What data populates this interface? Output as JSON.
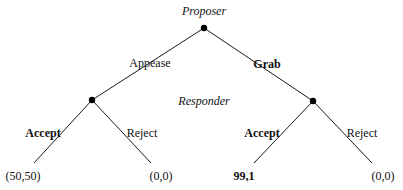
{
  "diagram": {
    "type": "extensive-form game tree",
    "players": {
      "root": "Proposer",
      "second": "Responder"
    },
    "nodes": {
      "root": {
        "x": 204,
        "y": 28
      },
      "left": {
        "x": 92,
        "y": 100
      },
      "right": {
        "x": 313,
        "y": 101
      }
    },
    "edges": {
      "appease": {
        "label": "Appease",
        "bold": false
      },
      "grab": {
        "label": "Grab",
        "bold": true
      },
      "left_accept": {
        "label": "Accept",
        "bold": true
      },
      "left_reject": {
        "label": "Reject",
        "bold": false
      },
      "right_accept": {
        "label": "Accept",
        "bold": true
      },
      "right_reject": {
        "label": "Reject",
        "bold": false
      }
    },
    "payoffs": {
      "appease_accept": "(50,50)",
      "appease_reject": "(0,0)",
      "grab_accept": "99,1",
      "grab_reject": "(0,0)"
    },
    "colors": {
      "line": "#1a1a1a",
      "node": "#000000",
      "text": "#111111",
      "background": "#ffffff"
    }
  }
}
